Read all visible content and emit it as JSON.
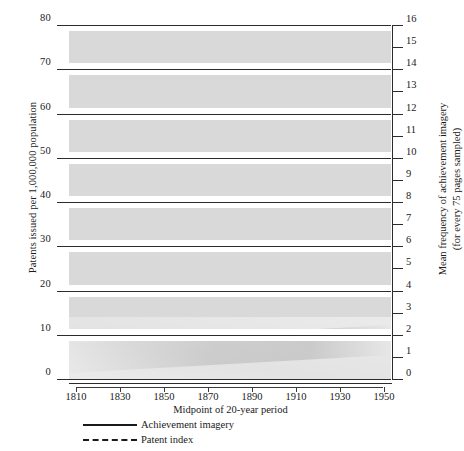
{
  "axes": {
    "left_title": "Patents issued per 1,000,000 population",
    "right_title_line1": "Mean frequency of achievement imagery",
    "right_title_line2": "(for every 75 pages sampled)",
    "x_title": "Midpoint of 20-year period",
    "left_ticks": [
      "0",
      "10",
      "20",
      "30",
      "40",
      "50",
      "60",
      "70",
      "80"
    ],
    "right_ticks": [
      "0",
      "1",
      "2",
      "3",
      "4",
      "5",
      "6",
      "7",
      "8",
      "9",
      "10",
      "11",
      "12",
      "13",
      "14",
      "15",
      "16"
    ],
    "x_ticks": [
      "1810",
      "1830",
      "1850",
      "1870",
      "1890",
      "1910",
      "1930",
      "1950"
    ]
  },
  "legend": {
    "items": [
      {
        "label": "Achievement imagery",
        "style": "solid"
      },
      {
        "label": "Patent index",
        "style": "dashed"
      }
    ]
  },
  "colors": {
    "plot_background": "#d9d9d9",
    "line": "#1a1a1a",
    "gridline": "#2b2b2b",
    "page": "#ffffff"
  },
  "chart_data": {
    "type": "line",
    "title": "",
    "xlabel": "Midpoint of 20-year period",
    "ylabel": "Patents issued per 1,000,000 population",
    "y2label": "Mean frequency of achievement imagery (for every 75 pages sampled)",
    "x": [
      1810,
      1830,
      1850,
      1870,
      1890,
      1910,
      1930,
      1950
    ],
    "xlim": [
      1810,
      1950
    ],
    "ylim": [
      0,
      80
    ],
    "y2lim": [
      0,
      16
    ],
    "grid": true,
    "legend_position": "below-axes-left",
    "series": [
      {
        "name": "Achievement imagery",
        "axis": "right",
        "style": "solid",
        "marker": "filled-circle",
        "values": [
          2.4,
          2.0,
          4.4,
          6.6,
          10.6,
          9.0,
          6.1,
          4.0
        ]
      },
      {
        "name": "Patent index",
        "axis": "left",
        "style": "dashed",
        "marker": "filled-circle",
        "values": [
          2,
          5,
          10,
          43,
          68,
          67,
          63,
          45
        ]
      }
    ]
  }
}
